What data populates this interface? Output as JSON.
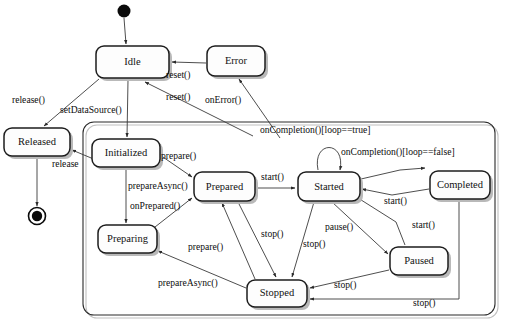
{
  "diagram": {
    "type": "uml-state-machine",
    "canvas": {
      "width": 508,
      "height": 326
    },
    "colors": {
      "background": "#ffffff",
      "state_fill": "#fdfdfd",
      "state_stroke": "#1c1c1c",
      "edge_stroke": "#3a3a3a",
      "shadow": "#b9b9b9",
      "text": "#111111"
    }
  },
  "nodes": {
    "initial": {
      "name": "initial-state",
      "cx": 124,
      "cy": 11,
      "r": 6.5
    },
    "final": {
      "name": "final-state",
      "cx": 37,
      "cy": 216,
      "r_outer": 8.5,
      "r_inner": 5.2
    }
  },
  "states": [
    {
      "id": "idle",
      "label": "Idle",
      "x": 96,
      "y": 46,
      "w": 73,
      "h": 32
    },
    {
      "id": "error",
      "label": "Error",
      "x": 207,
      "y": 46,
      "w": 58,
      "h": 30
    },
    {
      "id": "released",
      "label": "Released",
      "x": 4,
      "y": 128,
      "w": 66,
      "h": 28
    },
    {
      "id": "initialized",
      "label": "Initialized",
      "x": 92,
      "y": 139,
      "w": 68,
      "h": 28
    },
    {
      "id": "prepared",
      "label": "Prepared",
      "x": 194,
      "y": 172,
      "w": 61,
      "h": 29
    },
    {
      "id": "started",
      "label": "Started",
      "x": 298,
      "y": 172,
      "w": 62,
      "h": 29
    },
    {
      "id": "completed",
      "label": "Completed",
      "x": 430,
      "y": 171,
      "w": 60,
      "h": 28
    },
    {
      "id": "preparing",
      "label": "Preparing",
      "x": 98,
      "y": 225,
      "w": 59,
      "h": 28
    },
    {
      "id": "paused",
      "label": "Paused",
      "x": 390,
      "y": 247,
      "w": 58,
      "h": 28
    },
    {
      "id": "stopped",
      "label": "Stopped",
      "x": 247,
      "y": 280,
      "w": 60,
      "h": 27
    }
  ],
  "region": {
    "label": "",
    "x": 83,
    "y": 122,
    "w": 412,
    "h": 193
  },
  "transitions": [
    {
      "id": "t1",
      "from": "initial",
      "to": "idle",
      "label": ""
    },
    {
      "id": "t2",
      "from": "error",
      "to": "idle",
      "label": "reset()"
    },
    {
      "id": "t3",
      "from": "region",
      "to": "idle",
      "label": "reset()"
    },
    {
      "id": "t4",
      "from": "region",
      "to": "error",
      "label": "onError()"
    },
    {
      "id": "t5",
      "from": "idle",
      "to": "released",
      "label": "release()"
    },
    {
      "id": "t6",
      "from": "idle",
      "to": "initialized",
      "label": "setDataSource()"
    },
    {
      "id": "t7",
      "from": "region",
      "to": "released",
      "label": "release"
    },
    {
      "id": "t8",
      "from": "released",
      "to": "final",
      "label": ""
    },
    {
      "id": "t9",
      "from": "initialized",
      "to": "prepared",
      "label": "prepare()"
    },
    {
      "id": "t10",
      "from": "initialized",
      "to": "preparing",
      "label": "prepareAsync()"
    },
    {
      "id": "t11",
      "from": "preparing",
      "to": "prepared",
      "label": "onPrepared()"
    },
    {
      "id": "t12",
      "from": "prepared",
      "to": "started",
      "label": "start()"
    },
    {
      "id": "t13",
      "from": "started",
      "to": "started",
      "label": "onCompletion()[loop==true]"
    },
    {
      "id": "t14",
      "from": "started",
      "to": "completed",
      "label": "onCompletion()[loop==false]"
    },
    {
      "id": "t15",
      "from": "completed",
      "to": "started",
      "label": "start()"
    },
    {
      "id": "t16",
      "from": "paused",
      "to": "started",
      "label": "start()"
    },
    {
      "id": "t17",
      "from": "started",
      "to": "paused",
      "label": "pause()"
    },
    {
      "id": "t18",
      "from": "prepared",
      "to": "stopped",
      "label": "stop()"
    },
    {
      "id": "t19",
      "from": "started",
      "to": "stopped",
      "label": "stop()"
    },
    {
      "id": "t20",
      "from": "paused",
      "to": "stopped",
      "label": "stop()"
    },
    {
      "id": "t21",
      "from": "completed",
      "to": "stopped",
      "label": "stop()"
    },
    {
      "id": "t22",
      "from": "stopped",
      "to": "prepared",
      "label": "prepare()"
    },
    {
      "id": "t23",
      "from": "stopped",
      "to": "preparing",
      "label": "prepareAsync()"
    }
  ],
  "labels": {
    "reset_top": "reset()",
    "reset_mid": "reset()",
    "on_error": "onError()",
    "release_paren": "release()",
    "set_data_source": "setDataSource()",
    "release_plain": "release",
    "prepare_top": "prepare()",
    "prepare_async_top": "prepareAsync()",
    "on_prepared": "onPrepared()",
    "start_prepared": "start()",
    "on_completion_true": "onCompletion()[loop==true]",
    "on_completion_false": "onCompletion()[loop==false]",
    "start_completed": "start()",
    "start_paused": "start()",
    "pause": "pause()",
    "stop_prepared": "stop()",
    "stop_started": "stop()",
    "stop_paused": "stop()",
    "stop_completed": "stop()",
    "prepare_bottom": "prepare()",
    "prepare_async_bottom": "prepareAsync()"
  },
  "state_labels": {
    "idle": "Idle",
    "error": "Error",
    "released": "Released",
    "initialized": "Initialized",
    "prepared": "Prepared",
    "started": "Started",
    "completed": "Completed",
    "preparing": "Preparing",
    "paused": "Paused",
    "stopped": "Stopped"
  }
}
